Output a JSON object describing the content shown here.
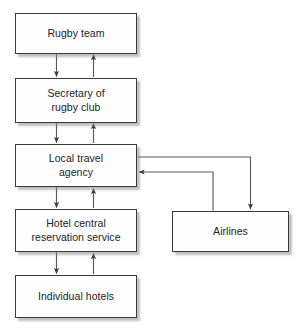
{
  "diagram": {
    "type": "flow-diagram",
    "title": "",
    "style": {
      "box_fill": "#fefefe",
      "box_border": "#3a3a3a",
      "text_color": "#232323",
      "connector_color": "#4a4a4a",
      "shadow_color": "#8c8c8c",
      "background": "#ffffff"
    },
    "nodes": [
      {
        "id": "rugby-team",
        "label": "Rugby team"
      },
      {
        "id": "secretary",
        "label": "Secretary of\nrugby club"
      },
      {
        "id": "local-travel",
        "label": "Local travel\nagency"
      },
      {
        "id": "hotel-central",
        "label": "Hotel central\nreservation service"
      },
      {
        "id": "individual-hotels",
        "label": "Individual hotels"
      },
      {
        "id": "airlines",
        "label": "Airlines"
      }
    ],
    "edges": [
      {
        "from": "rugby-team",
        "to": "secretary",
        "direction": "down"
      },
      {
        "from": "secretary",
        "to": "rugby-team",
        "direction": "up"
      },
      {
        "from": "secretary",
        "to": "local-travel",
        "direction": "down"
      },
      {
        "from": "local-travel",
        "to": "secretary",
        "direction": "up"
      },
      {
        "from": "local-travel",
        "to": "hotel-central",
        "direction": "down"
      },
      {
        "from": "hotel-central",
        "to": "local-travel",
        "direction": "up"
      },
      {
        "from": "hotel-central",
        "to": "individual-hotels",
        "direction": "down"
      },
      {
        "from": "individual-hotels",
        "to": "hotel-central",
        "direction": "up"
      },
      {
        "from": "local-travel",
        "to": "airlines",
        "direction": "right-then-down"
      },
      {
        "from": "airlines",
        "to": "local-travel",
        "direction": "up-then-left"
      }
    ]
  }
}
